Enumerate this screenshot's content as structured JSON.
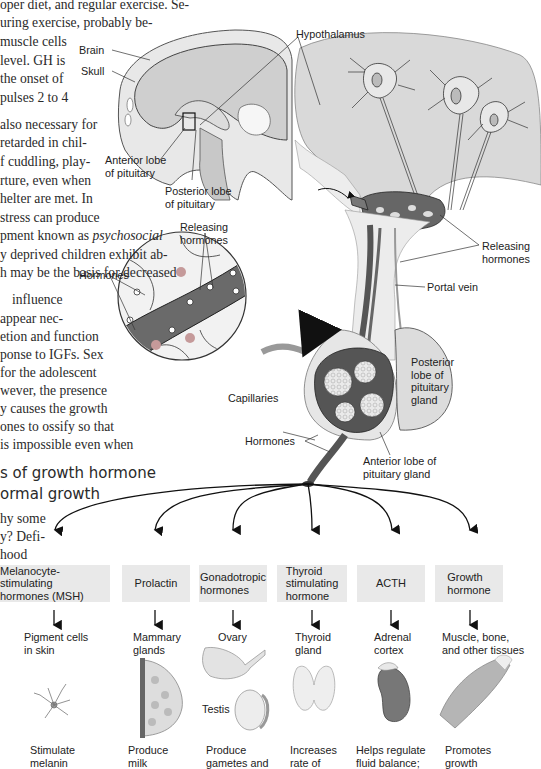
{
  "body_text": {
    "lines": [
      "oper diet, and regular exercise. Se-",
      "uring exercise, probably be-",
      "muscle cells",
      "level. GH is",
      "the onset of",
      "pulses 2 to 4",
      "also necessary for",
      "retarded in chil-",
      "f cuddling, play-",
      "rture, even when",
      "helter are met. In",
      "stress can produce",
      "pment known as",
      "psychosocial",
      "y deprived children exhibit ab-",
      "h may be the basis for decreased",
      "influence",
      "appear nec-",
      "etion and function",
      "ponse to IGFs. Sex",
      "for the adolescent",
      "wever, the presence",
      "y causes the growth",
      "ones to ossify so that",
      "is impossible even when"
    ],
    "heading_lines": [
      "s of growth hormone",
      "ormal growth"
    ],
    "after_heading": [
      "hy some",
      "y? Defi-",
      "hood"
    ]
  },
  "labels": {
    "brain": "Brain",
    "skull": "Skull",
    "hypothalamus": "Hypothalamus",
    "anterior_lobe_small": "Anterior lobe\nof pituitary",
    "posterior_lobe_small": "Posterior lobe\nof pituitary",
    "releasing_hormones_circle": "Releasing\nhormones",
    "hormones_circle": "Hormones",
    "releasing_hormones_right": "Releasing\nhormones",
    "portal_vein": "Portal vein",
    "posterior_lobe_gland": "Posterior\nlobe of\npituitary\ngland",
    "capillaries": "Capillaries",
    "hormones_bottom": "Hormones",
    "anterior_lobe_gland": "Anterior lobe of\npituitary gland"
  },
  "hormones": [
    {
      "name": "Melanocyte-stimulating\nhormones (MSH)",
      "target": "Pigment cells\nin skin",
      "effect": "Stimulate\nmelanin",
      "icon": "pigment-cell-icon"
    },
    {
      "name": "Prolactin",
      "target": "Mammary\nglands",
      "effect": "Produce\nmilk",
      "icon": "mammary-gland-icon"
    },
    {
      "name": "Gonadotropic\nhormones",
      "target": "Ovary",
      "target2": "Testis",
      "effect": "Produce\ngametes and",
      "icon": "ovary-testis-icon"
    },
    {
      "name": "Thyroid\nstimulating\nhormone",
      "target": "Thyroid\ngland",
      "effect": "Increases\nrate of",
      "icon": "thyroid-icon"
    },
    {
      "name": "ACTH",
      "target": "Adrenal\ncortex",
      "effect": "Helps regulate\nfluid balance;",
      "icon": "adrenal-icon"
    },
    {
      "name": "Growth\nhormone",
      "target": "Muscle, bone,\nand other tissues",
      "effect": "Promotes\ngrowth",
      "icon": "muscle-icon"
    }
  ],
  "colors": {
    "gray_fill": "#d6d6d6",
    "light_fill": "#ebebeb",
    "vessel": "#555555",
    "box": "#e9e9e9"
  }
}
